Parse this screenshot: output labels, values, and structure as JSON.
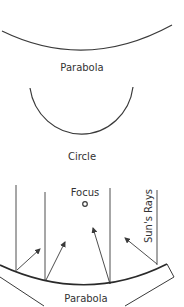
{
  "diagram": {
    "colors": {
      "stroke": "#3a3a3a",
      "text": "#333333",
      "background": "#ffffff"
    },
    "top_parabola": {
      "label": "Parabola"
    },
    "circle": {
      "label": "Circle"
    },
    "reflector": {
      "focus_label": "Focus",
      "rays_label": "Sun's Rays",
      "parabola_label": "Parabola",
      "focus_icon": "focus-point-icon",
      "ray_count": 4
    }
  }
}
